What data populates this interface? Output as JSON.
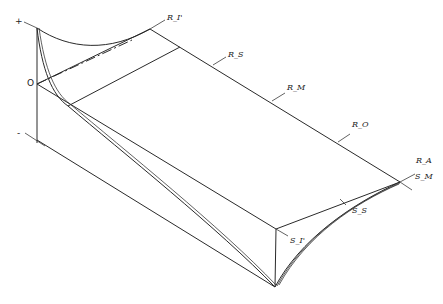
{
  "diagram": {
    "type": "isometric influence-surface sketch",
    "axis_labels": {
      "plus": "+",
      "zero": "O",
      "minus": "-"
    },
    "labels": {
      "R_I": "R_I'",
      "R_S": "R_S",
      "R_M": "R_M",
      "R_O": "R_O",
      "R_A": "R_A",
      "S_M": "S_M",
      "S_S": "S_S",
      "S_I": "S_I'"
    }
  }
}
